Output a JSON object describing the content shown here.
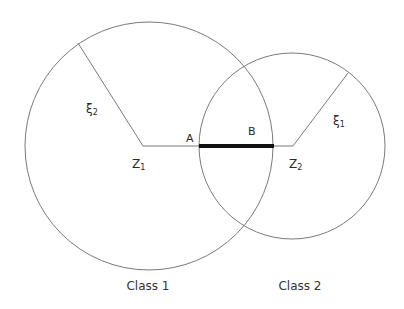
{
  "diagram": {
    "circles": [
      {
        "name": "class-1",
        "label": "Class 1",
        "center_label": "Z",
        "center_sub": "1",
        "radius_label": "ξ",
        "radius_sub": "2"
      },
      {
        "name": "class-2",
        "label": "Class 2",
        "center_label": "Z",
        "center_sub": "2",
        "radius_label": "ξ",
        "radius_sub": "1"
      }
    ],
    "segment": {
      "start_label": "A",
      "end_label": "B"
    },
    "colors": {
      "stroke": "#7a7a7a",
      "segment": "#111111",
      "text": "#2a2a2a"
    }
  }
}
